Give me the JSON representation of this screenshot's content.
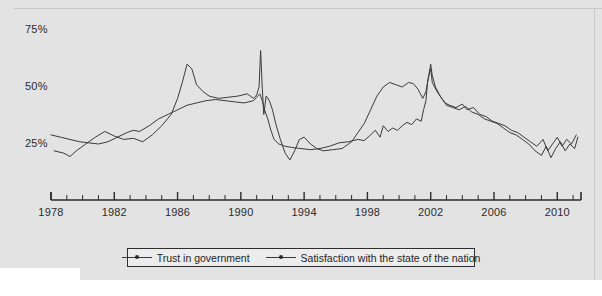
{
  "chart_data": {
    "type": "line",
    "title": "",
    "subtitle": "",
    "xlabel": "",
    "ylabel": "",
    "xlim": [
      1978,
      2011.5
    ],
    "ylim": [
      0,
      80
    ],
    "grid": false,
    "legend_position": "bottom-center",
    "y_ticks": [
      "25%",
      "50%",
      "75%"
    ],
    "y_tick_values": [
      25,
      50,
      75
    ],
    "x_ticks": [
      "1978",
      "1982",
      "1986",
      "1990",
      "1994",
      "1998",
      "2002",
      "2006",
      "2010"
    ],
    "x_tick_values": [
      1978,
      1982,
      1986,
      1990,
      1994,
      1998,
      2002,
      2006,
      2010
    ],
    "x_minor_interval": 1,
    "series": [
      {
        "name": "Trust in government",
        "color": "#3a3a3a",
        "marker": "dot",
        "points": [
          [
            1978.0,
            29.0
          ],
          [
            1978.6,
            28.0
          ],
          [
            1979.2,
            27.0
          ],
          [
            1979.8,
            26.0
          ],
          [
            1980.4,
            25.5
          ],
          [
            1981.0,
            25.0
          ],
          [
            1981.6,
            26.0
          ],
          [
            1982.2,
            28.0
          ],
          [
            1982.8,
            30.0
          ],
          [
            1983.2,
            31.0
          ],
          [
            1983.6,
            30.5
          ],
          [
            1984.2,
            33.0
          ],
          [
            1984.8,
            36.0
          ],
          [
            1985.4,
            38.0
          ],
          [
            1986.0,
            40.0
          ],
          [
            1986.6,
            42.0
          ],
          [
            1987.2,
            43.0
          ],
          [
            1987.8,
            44.0
          ],
          [
            1988.4,
            44.5
          ],
          [
            1989.0,
            44.0
          ],
          [
            1989.6,
            43.5
          ],
          [
            1990.2,
            43.0
          ],
          [
            1990.8,
            44.0
          ],
          [
            1991.0,
            45.5
          ],
          [
            1991.2,
            47.0
          ],
          [
            1991.35,
            44.0
          ],
          [
            1991.5,
            40.0
          ],
          [
            1991.7,
            36.0
          ],
          [
            1991.9,
            31.0
          ],
          [
            1992.1,
            27.0
          ],
          [
            1992.4,
            25.0
          ],
          [
            1992.8,
            24.0
          ],
          [
            1993.2,
            23.5
          ],
          [
            1993.8,
            23.0
          ],
          [
            1994.4,
            22.5
          ],
          [
            1995.0,
            23.0
          ],
          [
            1995.6,
            24.0
          ],
          [
            1996.2,
            25.5
          ],
          [
            1996.8,
            26.0
          ],
          [
            1997.4,
            27.0
          ],
          [
            1997.8,
            26.5
          ],
          [
            1998.2,
            29.0
          ],
          [
            1998.5,
            31.0
          ],
          [
            1998.8,
            28.0
          ],
          [
            1999.0,
            33.0
          ],
          [
            1999.3,
            30.5
          ],
          [
            1999.6,
            32.0
          ],
          [
            1999.9,
            31.0
          ],
          [
            2000.2,
            33.0
          ],
          [
            2000.5,
            34.5
          ],
          [
            2000.8,
            33.5
          ],
          [
            2001.1,
            36.0
          ],
          [
            2001.4,
            35.0
          ],
          [
            2001.55,
            40.0
          ],
          [
            2001.7,
            44.0
          ],
          [
            2001.8,
            52.0
          ],
          [
            2001.9,
            56.0
          ],
          [
            2002.0,
            60.0
          ],
          [
            2002.1,
            55.0
          ],
          [
            2002.3,
            50.0
          ],
          [
            2002.6,
            46.0
          ],
          [
            2002.9,
            43.0
          ],
          [
            2003.2,
            42.0
          ],
          [
            2003.6,
            41.0
          ],
          [
            2004.0,
            42.5
          ],
          [
            2004.3,
            40.0
          ],
          [
            2004.7,
            41.0
          ],
          [
            2005.1,
            38.0
          ],
          [
            2005.5,
            37.0
          ],
          [
            2005.9,
            35.0
          ],
          [
            2006.3,
            34.0
          ],
          [
            2006.7,
            33.0
          ],
          [
            2007.1,
            31.0
          ],
          [
            2007.5,
            30.0
          ],
          [
            2007.9,
            28.0
          ],
          [
            2008.3,
            26.0
          ],
          [
            2008.7,
            24.0
          ],
          [
            2009.1,
            27.0
          ],
          [
            2009.4,
            22.0
          ],
          [
            2009.7,
            25.0
          ],
          [
            2010.0,
            28.0
          ],
          [
            2010.3,
            24.0
          ],
          [
            2010.6,
            27.0
          ],
          [
            2010.9,
            25.0
          ],
          [
            2011.2,
            29.0
          ]
        ]
      },
      {
        "name": "Satisfaction with the state of the nation",
        "color": "#3a3a3a",
        "marker": "dot",
        "points": [
          [
            1978.2,
            22.0
          ],
          [
            1978.8,
            21.0
          ],
          [
            1979.2,
            19.5
          ],
          [
            1979.6,
            22.0
          ],
          [
            1980.2,
            25.0
          ],
          [
            1980.8,
            28.0
          ],
          [
            1981.4,
            30.5
          ],
          [
            1982.0,
            28.5
          ],
          [
            1982.6,
            27.0
          ],
          [
            1983.2,
            27.5
          ],
          [
            1983.8,
            26.0
          ],
          [
            1984.4,
            29.0
          ],
          [
            1985.0,
            33.0
          ],
          [
            1985.6,
            38.0
          ],
          [
            1986.0,
            45.0
          ],
          [
            1986.3,
            52.0
          ],
          [
            1986.6,
            60.0
          ],
          [
            1986.9,
            58.0
          ],
          [
            1987.2,
            51.0
          ],
          [
            1987.6,
            48.0
          ],
          [
            1988.0,
            46.0
          ],
          [
            1988.6,
            45.0
          ],
          [
            1989.2,
            45.5
          ],
          [
            1989.8,
            46.0
          ],
          [
            1990.4,
            47.0
          ],
          [
            1990.8,
            45.0
          ],
          [
            1991.0,
            46.5
          ],
          [
            1991.15,
            50.0
          ],
          [
            1991.25,
            66.0
          ],
          [
            1991.35,
            50.0
          ],
          [
            1991.45,
            38.0
          ],
          [
            1991.6,
            46.0
          ],
          [
            1991.8,
            44.0
          ],
          [
            1992.0,
            40.0
          ],
          [
            1992.2,
            34.0
          ],
          [
            1992.5,
            27.0
          ],
          [
            1992.8,
            21.0
          ],
          [
            1993.1,
            18.0
          ],
          [
            1993.4,
            22.0
          ],
          [
            1993.7,
            27.0
          ],
          [
            1994.0,
            28.0
          ],
          [
            1994.4,
            25.0
          ],
          [
            1994.8,
            23.0
          ],
          [
            1995.2,
            22.0
          ],
          [
            1995.8,
            22.5
          ],
          [
            1996.4,
            23.0
          ],
          [
            1997.0,
            26.0
          ],
          [
            1997.4,
            30.0
          ],
          [
            1997.8,
            34.0
          ],
          [
            1998.2,
            40.0
          ],
          [
            1998.6,
            46.0
          ],
          [
            1999.0,
            50.0
          ],
          [
            1999.4,
            52.0
          ],
          [
            1999.8,
            51.0
          ],
          [
            2000.2,
            50.0
          ],
          [
            2000.6,
            52.0
          ],
          [
            2000.9,
            51.5
          ],
          [
            2001.2,
            49.0
          ],
          [
            2001.5,
            45.0
          ],
          [
            2001.7,
            48.0
          ],
          [
            2001.85,
            54.0
          ],
          [
            2002.0,
            58.0
          ],
          [
            2002.1,
            52.0
          ],
          [
            2002.4,
            48.0
          ],
          [
            2002.7,
            45.0
          ],
          [
            2003.0,
            42.0
          ],
          [
            2003.4,
            41.0
          ],
          [
            2003.8,
            40.0
          ],
          [
            2004.2,
            41.5
          ],
          [
            2004.6,
            39.0
          ],
          [
            2005.0,
            38.0
          ],
          [
            2005.4,
            36.0
          ],
          [
            2005.8,
            35.0
          ],
          [
            2006.2,
            34.0
          ],
          [
            2006.6,
            32.0
          ],
          [
            2007.0,
            30.0
          ],
          [
            2007.4,
            29.0
          ],
          [
            2007.8,
            27.0
          ],
          [
            2008.2,
            25.0
          ],
          [
            2008.6,
            22.0
          ],
          [
            2009.0,
            20.0
          ],
          [
            2009.3,
            24.0
          ],
          [
            2009.6,
            19.0
          ],
          [
            2009.9,
            23.0
          ],
          [
            2010.2,
            26.0
          ],
          [
            2010.5,
            22.0
          ],
          [
            2010.8,
            25.0
          ],
          [
            2011.1,
            23.0
          ],
          [
            2011.3,
            28.0
          ]
        ]
      }
    ]
  },
  "axis": {
    "y_labels": [
      {
        "text": "75%",
        "value": 75
      },
      {
        "text": "50%",
        "value": 50
      },
      {
        "text": "25%",
        "value": 25
      }
    ],
    "x_labels": [
      {
        "text": "1978",
        "value": 1978
      },
      {
        "text": "1982",
        "value": 1982
      },
      {
        "text": "1986",
        "value": 1986
      },
      {
        "text": "1990",
        "value": 1990
      },
      {
        "text": "1994",
        "value": 1994
      },
      {
        "text": "1998",
        "value": 1998
      },
      {
        "text": "2002",
        "value": 2002
      },
      {
        "text": "2006",
        "value": 2006
      },
      {
        "text": "2010",
        "value": 2010
      }
    ]
  },
  "legend": {
    "entries": [
      {
        "label": "Trust in government"
      },
      {
        "label": "Satisfaction with the state of the nation"
      }
    ]
  }
}
